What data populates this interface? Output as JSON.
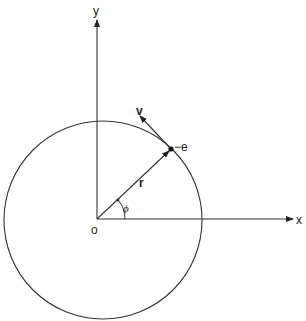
{
  "diagram": {
    "labels": {
      "y_axis": "y",
      "x_axis": "x",
      "origin": "o",
      "radius_vector": "r",
      "velocity": "v",
      "electron": "−e",
      "angle": "ϕ"
    },
    "geometry": {
      "origin": [
        97,
        219
      ],
      "circle_center": [
        103,
        220
      ],
      "circle_radius": 99,
      "electron_position": [
        171,
        149
      ],
      "velocity_tip": [
        140,
        117
      ],
      "x_axis_end": [
        292,
        219
      ],
      "y_axis_end": [
        97,
        18
      ]
    },
    "colors": {
      "stroke": "#333333",
      "background": "#ffffff"
    }
  }
}
